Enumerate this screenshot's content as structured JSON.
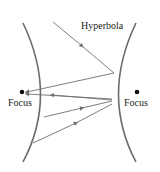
{
  "diagram": {
    "title_label": "Hyperbola",
    "left_focus_label": "Focus",
    "right_focus_label": "Focus",
    "colors": {
      "curve": "#6b6b6b",
      "ray": "#6f6f6f",
      "focus": "#111111",
      "text": "#222222"
    }
  }
}
